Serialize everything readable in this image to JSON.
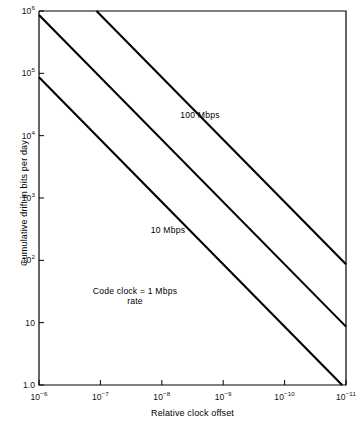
{
  "chart_data": {
    "type": "line",
    "title": "",
    "xlabel": "Relative clock offset",
    "ylabel": "Cumulative drift in bits per day",
    "xscale": "log",
    "yscale": "log",
    "xlim": [
      1e-06,
      1e-11
    ],
    "ylim": [
      1.0,
      1000000
    ],
    "x_inverted": true,
    "grid": false,
    "legend_position": "inline-annotations",
    "xticks": [
      {
        "value": 1e-06,
        "label": "10",
        "exponent": "−6"
      },
      {
        "value": 1e-07,
        "label": "10",
        "exponent": "−7"
      },
      {
        "value": 1e-08,
        "label": "10",
        "exponent": "−8"
      },
      {
        "value": 1e-09,
        "label": "10",
        "exponent": "−9"
      },
      {
        "value": 1e-10,
        "label": "10",
        "exponent": "−10"
      },
      {
        "value": 1e-11,
        "label": "10",
        "exponent": "−11"
      }
    ],
    "yticks": [
      {
        "value": 1000000,
        "label": "10",
        "exponent": "6"
      },
      {
        "value": 100000,
        "label": "10",
        "exponent": "5"
      },
      {
        "value": 10000,
        "label": "10",
        "exponent": "4"
      },
      {
        "value": 1000,
        "label": "10",
        "exponent": "3"
      },
      {
        "value": 100,
        "label": "10",
        "exponent": "2"
      },
      {
        "value": 10,
        "label": "10",
        "exponent": ""
      },
      {
        "value": 1,
        "label": "1.0",
        "exponent": ""
      }
    ],
    "series": [
      {
        "name": "100 Mbps",
        "label": "100 Mbps",
        "label_line2": "",
        "points": [
          {
            "x": 1e-06,
            "y": 8640000
          },
          {
            "x": 1e-11,
            "y": 86.4
          }
        ]
      },
      {
        "name": "10 Mbps",
        "label": "10 Mbps",
        "label_line2": "",
        "points": [
          {
            "x": 1e-06,
            "y": 864000
          },
          {
            "x": 1e-11,
            "y": 8.64
          }
        ]
      },
      {
        "name": "1 Mbps",
        "label": "Code clock = 1 Mbps",
        "label_line2": "rate",
        "points": [
          {
            "x": 1e-06,
            "y": 86400
          },
          {
            "x": 1e-11,
            "y": 0.864
          }
        ]
      }
    ],
    "colors": {
      "line": "#000000",
      "axis": "#000000",
      "background": "#ffffff",
      "text": "#111111"
    }
  },
  "geometry": {
    "plot_left": 39,
    "plot_right": 346,
    "plot_top": 11,
    "plot_bottom": 385
  },
  "annotations": [
    {
      "name": "series-label-100mbps",
      "text": "100 Mbps",
      "x": 200,
      "y": 110
    },
    {
      "name": "series-label-10mbps",
      "text": "10 Mbps",
      "x": 168,
      "y": 225
    },
    {
      "name": "series-label-1mbps",
      "text": "Code clock = 1 Mbps",
      "text2": "rate",
      "x": 135,
      "y": 286
    }
  ]
}
